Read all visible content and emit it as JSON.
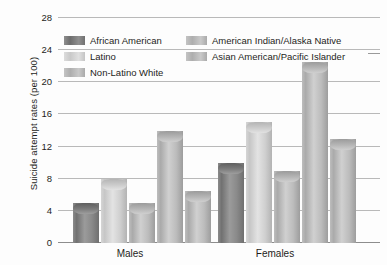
{
  "chart_data": {
    "type": "bar",
    "title": "",
    "xlabel": "",
    "ylabel": "Suicide attempt rates (per 100)",
    "categories": [
      "Males",
      "Females"
    ],
    "ylim": [
      0,
      28
    ],
    "yticks": [
      0,
      4,
      8,
      12,
      16,
      20,
      24,
      28
    ],
    "ytick_labels": [
      "0",
      "4",
      "8",
      "12",
      "16",
      "20",
      "24",
      "28"
    ],
    "grid": true,
    "legend_position": "top-inside",
    "series": [
      {
        "name": "African American",
        "values": [
          5.0,
          10.0
        ],
        "color": "#7d7d7d"
      },
      {
        "name": "Latino",
        "values": [
          8.0,
          15.0
        ],
        "color": "#d2d2d2"
      },
      {
        "name": "Non-Latino White",
        "values": [
          5.0,
          9.0
        ],
        "color": "#bbbbbb"
      },
      {
        "name": "American Indian/Alaska Native",
        "values": [
          14.0,
          22.5
        ],
        "color": "#b4b4b4"
      },
      {
        "name": "Asian American/Pacific Islander",
        "values": [
          6.5,
          13.0
        ],
        "color": "#b4b4b4"
      }
    ]
  },
  "axis": {
    "y_title": "Suicide attempt rates (per 100)",
    "ticks": [
      "28",
      "24",
      "20",
      "16",
      "12",
      "8",
      "4",
      "0"
    ]
  },
  "groups": [
    {
      "label": "Males"
    },
    {
      "label": "Females"
    }
  ],
  "legend": {
    "items": [
      {
        "label": "African American",
        "swatch": "dark"
      },
      {
        "label": "American Indian/Alaska Native",
        "swatch": "mid"
      },
      {
        "label": "Latino",
        "swatch": "light"
      },
      {
        "label": "Asian American/Pacific Islander",
        "swatch": "mid"
      },
      {
        "label": "Non-Latino White",
        "swatch": "mid"
      }
    ]
  }
}
